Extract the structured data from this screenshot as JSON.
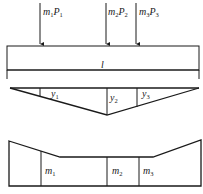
{
  "diagram": {
    "loads": [
      {
        "label_m": "m",
        "sub_m": "1",
        "label_p": "P",
        "sub_p": "1",
        "x": 40
      },
      {
        "label_m": "m",
        "sub_m": "2",
        "label_p": "P",
        "sub_p": "2",
        "x": 106
      },
      {
        "label_m": "m",
        "sub_m": "3",
        "label_p": "P",
        "sub_p": "3",
        "x": 136
      }
    ],
    "span_label": "l",
    "influence_line": {
      "ordinates": [
        {
          "label": "y",
          "sub": "1"
        },
        {
          "label": "y",
          "sub": "2"
        },
        {
          "label": "y",
          "sub": "3"
        }
      ]
    },
    "distribution": {
      "segments": [
        {
          "label": "m",
          "sub": "1"
        },
        {
          "label": "m",
          "sub": "2"
        },
        {
          "label": "m",
          "sub": "3"
        }
      ]
    },
    "colors": {
      "line": "#1a1a1a",
      "background": "#ffffff"
    }
  }
}
